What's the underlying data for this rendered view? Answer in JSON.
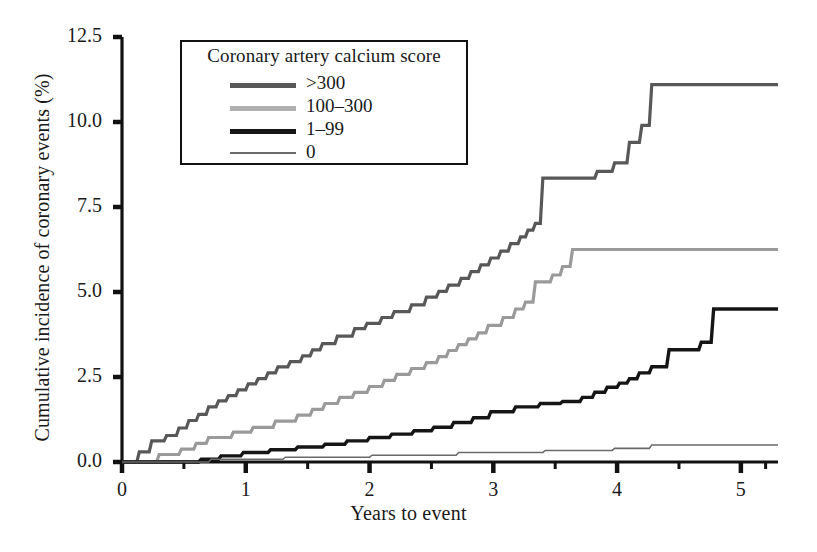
{
  "chart_data": {
    "type": "line",
    "title": "",
    "xlabel": "Years to event",
    "ylabel": "Cumulative incidence of coronary events (%)",
    "xlim": [
      0,
      5.3
    ],
    "ylim": [
      0,
      12.5
    ],
    "xticks": [
      "0",
      "1",
      "2",
      "3",
      "4",
      "5"
    ],
    "xtick_values": [
      0,
      1,
      2,
      3,
      4,
      5
    ],
    "xminor_ticks": [
      0.5,
      1.5,
      2.5,
      3.5,
      4.5,
      5.2
    ],
    "yticks": [
      "0.0",
      "2.5",
      "5.0",
      "7.5",
      "10.0",
      "12.5"
    ],
    "ytick_values": [
      0,
      2.5,
      5,
      7.5,
      10,
      12.5
    ],
    "grid": false,
    "legend_position": "upper-left-inside",
    "legend_title": "Coronary artery calcium score",
    "step_type": "post",
    "series": [
      {
        "name": ">300",
        "color": "#585858",
        "width": 3.2,
        "final_value": 11.1,
        "points": [
          [
            0.0,
            0.0
          ],
          [
            0.12,
            0.0
          ],
          [
            0.14,
            0.3
          ],
          [
            0.22,
            0.3
          ],
          [
            0.24,
            0.62
          ],
          [
            0.34,
            0.62
          ],
          [
            0.36,
            0.78
          ],
          [
            0.44,
            0.78
          ],
          [
            0.46,
            1.0
          ],
          [
            0.52,
            1.0
          ],
          [
            0.54,
            1.22
          ],
          [
            0.6,
            1.22
          ],
          [
            0.62,
            1.4
          ],
          [
            0.68,
            1.4
          ],
          [
            0.7,
            1.62
          ],
          [
            0.76,
            1.62
          ],
          [
            0.78,
            1.8
          ],
          [
            0.84,
            1.8
          ],
          [
            0.86,
            1.95
          ],
          [
            0.92,
            1.95
          ],
          [
            0.94,
            2.12
          ],
          [
            1.0,
            2.12
          ],
          [
            1.02,
            2.3
          ],
          [
            1.08,
            2.3
          ],
          [
            1.1,
            2.45
          ],
          [
            1.16,
            2.45
          ],
          [
            1.18,
            2.62
          ],
          [
            1.24,
            2.62
          ],
          [
            1.26,
            2.8
          ],
          [
            1.34,
            2.8
          ],
          [
            1.36,
            2.95
          ],
          [
            1.44,
            2.95
          ],
          [
            1.46,
            3.12
          ],
          [
            1.52,
            3.12
          ],
          [
            1.54,
            3.3
          ],
          [
            1.6,
            3.3
          ],
          [
            1.62,
            3.48
          ],
          [
            1.72,
            3.48
          ],
          [
            1.74,
            3.7
          ],
          [
            1.86,
            3.7
          ],
          [
            1.88,
            3.92
          ],
          [
            1.96,
            3.92
          ],
          [
            1.98,
            4.08
          ],
          [
            2.08,
            4.08
          ],
          [
            2.1,
            4.25
          ],
          [
            2.18,
            4.25
          ],
          [
            2.2,
            4.42
          ],
          [
            2.32,
            4.42
          ],
          [
            2.34,
            4.62
          ],
          [
            2.44,
            4.62
          ],
          [
            2.46,
            4.85
          ],
          [
            2.54,
            4.85
          ],
          [
            2.56,
            5.02
          ],
          [
            2.62,
            5.02
          ],
          [
            2.64,
            5.2
          ],
          [
            2.72,
            5.2
          ],
          [
            2.74,
            5.4
          ],
          [
            2.8,
            5.4
          ],
          [
            2.82,
            5.6
          ],
          [
            2.88,
            5.6
          ],
          [
            2.9,
            5.8
          ],
          [
            2.96,
            5.8
          ],
          [
            2.98,
            6.0
          ],
          [
            3.04,
            6.0
          ],
          [
            3.06,
            6.2
          ],
          [
            3.12,
            6.2
          ],
          [
            3.14,
            6.42
          ],
          [
            3.2,
            6.42
          ],
          [
            3.22,
            6.62
          ],
          [
            3.26,
            6.62
          ],
          [
            3.28,
            6.82
          ],
          [
            3.32,
            6.82
          ],
          [
            3.34,
            7.02
          ],
          [
            3.38,
            7.02
          ],
          [
            3.4,
            8.35
          ],
          [
            3.82,
            8.35
          ],
          [
            3.84,
            8.55
          ],
          [
            3.96,
            8.55
          ],
          [
            3.98,
            8.8
          ],
          [
            4.08,
            8.8
          ],
          [
            4.1,
            9.4
          ],
          [
            4.18,
            9.4
          ],
          [
            4.2,
            9.9
          ],
          [
            4.26,
            9.9
          ],
          [
            4.28,
            11.1
          ],
          [
            5.3,
            11.1
          ]
        ]
      },
      {
        "name": "100-300",
        "color": "#9a9a9a",
        "width": 3.2,
        "final_value": 6.25,
        "points": [
          [
            0.0,
            0.0
          ],
          [
            0.28,
            0.0
          ],
          [
            0.3,
            0.22
          ],
          [
            0.46,
            0.22
          ],
          [
            0.48,
            0.38
          ],
          [
            0.58,
            0.38
          ],
          [
            0.6,
            0.55
          ],
          [
            0.68,
            0.55
          ],
          [
            0.7,
            0.72
          ],
          [
            0.88,
            0.72
          ],
          [
            0.9,
            0.88
          ],
          [
            1.04,
            0.88
          ],
          [
            1.06,
            1.02
          ],
          [
            1.22,
            1.02
          ],
          [
            1.24,
            1.2
          ],
          [
            1.4,
            1.2
          ],
          [
            1.42,
            1.38
          ],
          [
            1.52,
            1.38
          ],
          [
            1.54,
            1.55
          ],
          [
            1.62,
            1.55
          ],
          [
            1.64,
            1.72
          ],
          [
            1.74,
            1.72
          ],
          [
            1.76,
            1.9
          ],
          [
            1.86,
            1.9
          ],
          [
            1.88,
            2.05
          ],
          [
            1.98,
            2.05
          ],
          [
            2.0,
            2.22
          ],
          [
            2.1,
            2.22
          ],
          [
            2.12,
            2.4
          ],
          [
            2.2,
            2.4
          ],
          [
            2.22,
            2.58
          ],
          [
            2.32,
            2.58
          ],
          [
            2.34,
            2.75
          ],
          [
            2.44,
            2.75
          ],
          [
            2.46,
            2.92
          ],
          [
            2.54,
            2.92
          ],
          [
            2.56,
            3.1
          ],
          [
            2.62,
            3.1
          ],
          [
            2.64,
            3.28
          ],
          [
            2.7,
            3.28
          ],
          [
            2.72,
            3.45
          ],
          [
            2.78,
            3.45
          ],
          [
            2.8,
            3.62
          ],
          [
            2.86,
            3.62
          ],
          [
            2.88,
            3.8
          ],
          [
            2.94,
            3.8
          ],
          [
            2.96,
            4.02
          ],
          [
            3.06,
            4.02
          ],
          [
            3.08,
            4.25
          ],
          [
            3.16,
            4.25
          ],
          [
            3.18,
            4.5
          ],
          [
            3.24,
            4.5
          ],
          [
            3.26,
            4.7
          ],
          [
            3.32,
            4.7
          ],
          [
            3.34,
            5.3
          ],
          [
            3.46,
            5.3
          ],
          [
            3.48,
            5.5
          ],
          [
            3.54,
            5.5
          ],
          [
            3.56,
            5.75
          ],
          [
            3.62,
            5.75
          ],
          [
            3.64,
            6.25
          ],
          [
            5.3,
            6.25
          ]
        ]
      },
      {
        "name": "1-99",
        "color": "#151515",
        "width": 3.4,
        "final_value": 4.5,
        "points": [
          [
            0.0,
            0.0
          ],
          [
            0.62,
            0.0
          ],
          [
            0.64,
            0.08
          ],
          [
            0.78,
            0.08
          ],
          [
            0.8,
            0.18
          ],
          [
            0.96,
            0.18
          ],
          [
            0.98,
            0.28
          ],
          [
            1.18,
            0.28
          ],
          [
            1.2,
            0.36
          ],
          [
            1.4,
            0.36
          ],
          [
            1.42,
            0.44
          ],
          [
            1.62,
            0.44
          ],
          [
            1.64,
            0.52
          ],
          [
            1.8,
            0.52
          ],
          [
            1.82,
            0.62
          ],
          [
            1.98,
            0.62
          ],
          [
            2.0,
            0.72
          ],
          [
            2.16,
            0.72
          ],
          [
            2.18,
            0.82
          ],
          [
            2.34,
            0.82
          ],
          [
            2.36,
            0.92
          ],
          [
            2.5,
            0.92
          ],
          [
            2.52,
            1.02
          ],
          [
            2.66,
            1.02
          ],
          [
            2.68,
            1.16
          ],
          [
            2.82,
            1.16
          ],
          [
            2.84,
            1.3
          ],
          [
            2.96,
            1.3
          ],
          [
            2.98,
            1.48
          ],
          [
            3.16,
            1.48
          ],
          [
            3.18,
            1.62
          ],
          [
            3.36,
            1.62
          ],
          [
            3.38,
            1.72
          ],
          [
            3.54,
            1.72
          ],
          [
            3.56,
            1.78
          ],
          [
            3.7,
            1.78
          ],
          [
            3.72,
            1.9
          ],
          [
            3.8,
            1.9
          ],
          [
            3.82,
            2.05
          ],
          [
            3.9,
            2.05
          ],
          [
            3.92,
            2.2
          ],
          [
            4.0,
            2.2
          ],
          [
            4.02,
            2.32
          ],
          [
            4.08,
            2.32
          ],
          [
            4.1,
            2.45
          ],
          [
            4.16,
            2.45
          ],
          [
            4.18,
            2.62
          ],
          [
            4.26,
            2.62
          ],
          [
            4.28,
            2.8
          ],
          [
            4.4,
            2.8
          ],
          [
            4.42,
            3.3
          ],
          [
            4.66,
            3.3
          ],
          [
            4.68,
            3.52
          ],
          [
            4.76,
            3.52
          ],
          [
            4.78,
            4.5
          ],
          [
            5.3,
            4.5
          ]
        ]
      },
      {
        "name": "0",
        "color": "#6a6a6a",
        "width": 1.6,
        "final_value": 0.5,
        "points": [
          [
            0.0,
            0.0
          ],
          [
            0.7,
            0.0
          ],
          [
            0.72,
            0.08
          ],
          [
            1.3,
            0.08
          ],
          [
            1.32,
            0.14
          ],
          [
            2.0,
            0.14
          ],
          [
            2.02,
            0.2
          ],
          [
            2.7,
            0.2
          ],
          [
            2.72,
            0.28
          ],
          [
            3.4,
            0.28
          ],
          [
            3.42,
            0.34
          ],
          [
            3.96,
            0.34
          ],
          [
            3.98,
            0.4
          ],
          [
            4.26,
            0.4
          ],
          [
            4.28,
            0.5
          ],
          [
            5.3,
            0.5
          ]
        ]
      }
    ]
  },
  "legend": {
    "title": "Coronary artery calcium score",
    "items": [
      {
        "label": ">300",
        "color": "#585858",
        "thickness": "5px"
      },
      {
        "label": "100–300",
        "color": "#b0b0b0",
        "thickness": "5px"
      },
      {
        "label": "1–99",
        "color": "#151515",
        "thickness": "5px"
      },
      {
        "label": "0",
        "color": "#6a6a6a",
        "thickness": "2px"
      }
    ]
  },
  "axes": {
    "x_axis_label": "Years to event",
    "y_axis_label": "Cumulative incidence of coronary events (%)",
    "x_tick_labels": [
      "0",
      "1",
      "2",
      "3",
      "4",
      "5"
    ],
    "y_tick_labels": [
      "0.0",
      "2.5",
      "5.0",
      "7.5",
      "10.0",
      "12.5"
    ]
  }
}
